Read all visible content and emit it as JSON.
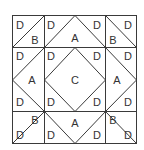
{
  "diagram": {
    "type": "quilt-block",
    "line_color": "#3a3a3a",
    "background": "#ffffff",
    "grid": {
      "x": [
        12,
        44,
        105,
        137
      ],
      "y": [
        15,
        47,
        111,
        143
      ]
    },
    "labels": [
      {
        "id": "tl-d",
        "text": "D",
        "x": 20,
        "y": 25
      },
      {
        "id": "tl-b",
        "text": "B",
        "x": 35,
        "y": 40
      },
      {
        "id": "tm-d1",
        "text": "D",
        "x": 51,
        "y": 25
      },
      {
        "id": "tm-a",
        "text": "A",
        "x": 75,
        "y": 38
      },
      {
        "id": "tm-d2",
        "text": "D",
        "x": 97,
        "y": 25
      },
      {
        "id": "tr-b",
        "text": "B",
        "x": 113,
        "y": 40
      },
      {
        "id": "tr-d",
        "text": "D",
        "x": 128,
        "y": 25
      },
      {
        "id": "ml-d1",
        "text": "D",
        "x": 20,
        "y": 56
      },
      {
        "id": "ml-a",
        "text": "A",
        "x": 32,
        "y": 80
      },
      {
        "id": "ml-d2",
        "text": "D",
        "x": 20,
        "y": 102
      },
      {
        "id": "c-d1",
        "text": "D",
        "x": 51,
        "y": 56
      },
      {
        "id": "c-c",
        "text": "C",
        "x": 75,
        "y": 80
      },
      {
        "id": "c-d2",
        "text": "D",
        "x": 97,
        "y": 56
      },
      {
        "id": "c-d3",
        "text": "D",
        "x": 51,
        "y": 102
      },
      {
        "id": "c-d4",
        "text": "D",
        "x": 97,
        "y": 102
      },
      {
        "id": "mr-d1",
        "text": "D",
        "x": 128,
        "y": 56
      },
      {
        "id": "mr-a",
        "text": "A",
        "x": 117,
        "y": 80
      },
      {
        "id": "mr-d2",
        "text": "D",
        "x": 128,
        "y": 102
      },
      {
        "id": "bl-b",
        "text": "B",
        "x": 35,
        "y": 120
      },
      {
        "id": "bl-d",
        "text": "D",
        "x": 20,
        "y": 135
      },
      {
        "id": "bm-d1",
        "text": "D",
        "x": 51,
        "y": 135
      },
      {
        "id": "bm-a",
        "text": "A",
        "x": 75,
        "y": 123
      },
      {
        "id": "bm-d2",
        "text": "D",
        "x": 97,
        "y": 135
      },
      {
        "id": "br-b",
        "text": "B",
        "x": 113,
        "y": 120
      },
      {
        "id": "br-d",
        "text": "D",
        "x": 128,
        "y": 135
      }
    ],
    "legend": [
      "A",
      "B",
      "C",
      "D"
    ]
  }
}
